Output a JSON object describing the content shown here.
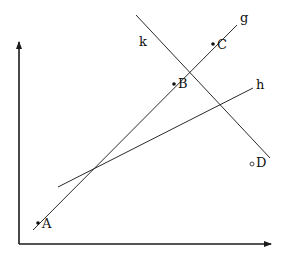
{
  "diagram": {
    "type": "geometry-lines",
    "axes": {
      "origin": [
        19,
        244
      ],
      "y_axis_top": [
        19,
        42
      ],
      "x_axis_end": [
        271,
        244
      ],
      "color": "#1a1a1a"
    },
    "lines": [
      {
        "name": "g",
        "label": "g",
        "from": [
          33,
          230
        ],
        "to": [
          237,
          25
        ],
        "label_pos": [
          240,
          22
        ]
      },
      {
        "name": "h",
        "label": "h",
        "from": [
          58,
          187
        ],
        "to": [
          253,
          88
        ],
        "label_pos": [
          256,
          89
        ]
      },
      {
        "name": "k",
        "label": "k",
        "from": [
          136,
          15
        ],
        "to": [
          270,
          158
        ],
        "label_pos": [
          139,
          46
        ]
      }
    ],
    "points": [
      {
        "name": "A",
        "label": "A",
        "pos": [
          38,
          223
        ],
        "style": "filled",
        "label_pos": [
          42,
          228
        ]
      },
      {
        "name": "B",
        "label": "B",
        "pos": [
          174,
          84
        ],
        "style": "filled",
        "label_pos": [
          178,
          88
        ]
      },
      {
        "name": "C",
        "label": "C",
        "pos": [
          213,
          44
        ],
        "style": "filled",
        "label_pos": [
          217,
          49
        ]
      },
      {
        "name": "D",
        "label": "D",
        "pos": [
          252,
          164
        ],
        "style": "open",
        "label_pos": [
          256,
          167
        ]
      }
    ]
  }
}
